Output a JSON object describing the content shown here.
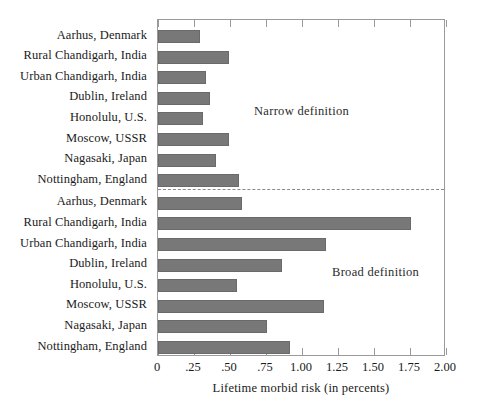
{
  "chart_data": {
    "type": "bar",
    "orientation": "horizontal",
    "title": "",
    "xlabel": "Lifetime morbid risk (in percents)",
    "ylabel": "",
    "xlim": [
      0,
      2.0
    ],
    "xticks": [
      0,
      0.25,
      0.5,
      0.75,
      1.0,
      1.25,
      1.5,
      1.75,
      2.0
    ],
    "xticklabels": [
      "0",
      ".25",
      ".50",
      ".75",
      "1.00",
      "1.25",
      "1.50",
      "1.75",
      "2.00"
    ],
    "grid": false,
    "legend": "none",
    "bar_color": "#787878",
    "frame_color": "#9a9a9a",
    "sections": [
      {
        "name": "narrow",
        "annotation": "Narrow definition",
        "categories": [
          "Aarhus, Denmark",
          "Rural Chandigarh, India",
          "Urban Chandigarh, India",
          "Dublin, Ireland",
          "Honolulu, U.S.",
          "Moscow, USSR",
          "Nagasaki, Japan",
          "Nottingham, England"
        ],
        "values": [
          0.29,
          0.49,
          0.33,
          0.36,
          0.31,
          0.49,
          0.4,
          0.56
        ]
      },
      {
        "name": "broad",
        "annotation": "Broad definition",
        "categories": [
          "Aarhus, Denmark",
          "Rural Chandigarh, India",
          "Urban Chandigarh, India",
          "Dublin, Ireland",
          "Honolulu, U.S.",
          "Moscow, USSR",
          "Nagasaki, Japan",
          "Nottingham, England"
        ],
        "values": [
          0.58,
          1.76,
          1.17,
          0.86,
          0.55,
          1.15,
          0.76,
          0.92
        ]
      }
    ]
  }
}
